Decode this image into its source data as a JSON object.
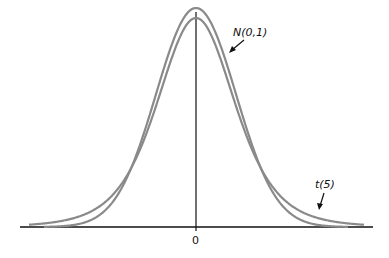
{
  "chart_data": {
    "type": "line",
    "title": "",
    "xlabel": "",
    "ylabel": "",
    "x_ticks": [
      "0"
    ],
    "grid": false,
    "legend": "annotations",
    "series": [
      {
        "name": "N(0,1)",
        "distribution": "normal",
        "df": null,
        "color": "#8a8a8a"
      },
      {
        "name": "t(5)",
        "distribution": "student-t",
        "df": 5,
        "color": "#8a8a8a"
      }
    ],
    "annotations": [
      {
        "text": "N(0,1)",
        "points_to": "N(0,1) curve, right shoulder"
      },
      {
        "text": "t(5)",
        "points_to": "t(5) curve, right tail"
      }
    ],
    "xlim": [
      -4.2,
      4.2
    ]
  },
  "labels": {
    "normal": "N(0,1)",
    "t": "t(5)",
    "zero": "0"
  }
}
